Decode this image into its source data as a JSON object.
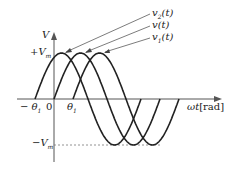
{
  "diagram": {
    "axis_y_label": "V",
    "axis_x_label": "ωt",
    "axis_x_unit": "[rad]",
    "vm_pos": "+V",
    "vm_neg": "−V",
    "vm_sub": "m",
    "origin": "0",
    "theta_neg": "− θ",
    "theta_pos": "θ",
    "theta_sub": "1",
    "curves": [
      {
        "name": "v2(t)",
        "label": "v",
        "sub": "2",
        "arg": "(t)",
        "phase_shift": "+θ1"
      },
      {
        "name": "v(t)",
        "label": "v",
        "sub": "",
        "arg": "(t)",
        "phase_shift": "0"
      },
      {
        "name": "v1(t)",
        "label": "v",
        "sub": "1",
        "arg": "(t)",
        "phase_shift": "−θ1"
      }
    ],
    "line_color": "#222222",
    "axis_color": "#555555"
  }
}
